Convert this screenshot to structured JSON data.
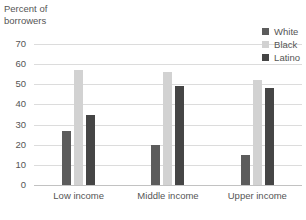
{
  "chart_data": {
    "type": "bar",
    "title": "Percent of borrowers",
    "xlabel": "",
    "ylabel": "Percent of borrowers",
    "ylim": [
      0,
      70
    ],
    "yticks": [
      70,
      60,
      50,
      40,
      30,
      20,
      10,
      0
    ],
    "grid": true,
    "legend_position": "top-right",
    "categories": [
      "Low income",
      "Middle income",
      "Upper income"
    ],
    "series": [
      {
        "name": "White",
        "color": "#5c5c5c",
        "values": [
          27,
          20,
          15
        ]
      },
      {
        "name": "Black",
        "color": "#d2d2d2",
        "values": [
          57,
          56,
          52
        ]
      },
      {
        "name": "Latino",
        "color": "#454545",
        "values": [
          35,
          49,
          48
        ]
      }
    ]
  },
  "axis_title": {
    "line1": "Percent of",
    "line2": "borrowers",
    "text": "Percent of\nborrowers"
  },
  "colors": {
    "background": "#ffffff",
    "gridline": "#dcdcdc",
    "axis": "#c2c2c2",
    "text": "#555555"
  }
}
